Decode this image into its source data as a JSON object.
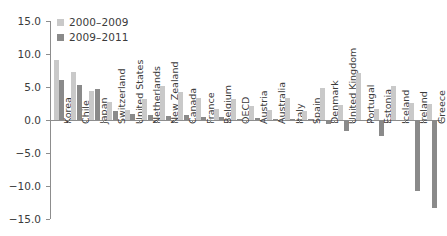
{
  "chart_data": {
    "type": "bar",
    "title": "",
    "subtitle": "",
    "xlabel": "",
    "ylabel": "",
    "ylim": [
      -15.0,
      15.0
    ],
    "yticks": [
      15.0,
      10.0,
      5.0,
      0.0,
      -5.0,
      -10.0,
      -15.0
    ],
    "ytick_labels": [
      "15.0",
      "10.0",
      "5.0",
      "0.0",
      "−5.0",
      "−10.0",
      "−15.0"
    ],
    "grid": false,
    "legend_position": "top-left",
    "categories": [
      "Korea",
      "Chile",
      "Japan",
      "Switzerland",
      "United States",
      "Netherlands",
      "New Zealand",
      "Canada",
      "France",
      "Belgium",
      "OECD",
      "Austria",
      "Australia",
      "Italy",
      "Spain",
      "Denmark",
      "United Kingdom",
      "Portugal",
      "Estonia",
      "Iceland",
      "Ireland",
      "Greece"
    ],
    "series": [
      {
        "name": "2000–2009",
        "color": "#c9c9c9",
        "values": [
          9.1,
          7.3,
          4.4,
          2.7,
          1.5,
          3.2,
          5.2,
          4.3,
          3.3,
          1.7,
          3.2,
          2.2,
          1.5,
          3.4,
          1.3,
          4.9,
          2.3,
          7.1,
          1.7,
          5.1,
          2.6,
          2.4
        ]
      },
      {
        "name": "2009–2011",
        "color": "#8a8a8a",
        "values": [
          6.1,
          5.3,
          4.7,
          1.3,
          0.9,
          0.7,
          0.6,
          0.7,
          0.5,
          0.4,
          0.2,
          0.3,
          0.1,
          0.2,
          0.1,
          -0.6,
          -1.6,
          0.0,
          -2.4,
          -0.1,
          -10.7,
          -13.4
        ]
      }
    ]
  },
  "legend": {
    "items": [
      {
        "label": "2000–2009",
        "color": "#c9c9c9"
      },
      {
        "label": "2009–2011",
        "color": "#8a8a8a"
      }
    ]
  },
  "colors": {
    "series_light": "#c9c9c9",
    "series_dark": "#8a8a8a",
    "axis": "#8d8d8d",
    "text": "#3b3b3b",
    "background": "#ffffff"
  }
}
